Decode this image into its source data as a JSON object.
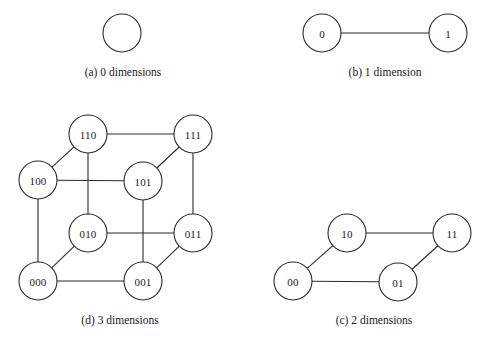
{
  "figure": {
    "background_color": "#ffffff",
    "stroke_color": "#2b2b2b",
    "node_fill_color": "#ffffff",
    "text_color": "#1a1a1a"
  },
  "chart_data": {
    "type": "diagram",
    "panels": [
      {
        "id": "a",
        "caption": "(a) 0 dimensions",
        "caption_x": 123,
        "caption_y": 72,
        "node_radius": 19,
        "nodes": [
          {
            "id": "a0",
            "label": "",
            "cx": 122,
            "cy": 33
          }
        ],
        "edges": []
      },
      {
        "id": "b",
        "caption": "(b) 1 dimension",
        "caption_x": 385,
        "caption_y": 72,
        "node_radius": 19,
        "nodes": [
          {
            "id": "b0",
            "label": "0",
            "cx": 322,
            "cy": 33
          },
          {
            "id": "b1",
            "label": "1",
            "cx": 448,
            "cy": 33
          }
        ],
        "edges": [
          {
            "from": "b0",
            "to": "b1"
          }
        ]
      },
      {
        "id": "c",
        "caption": "(c) 2 dimensions",
        "caption_x": 374,
        "caption_y": 320,
        "node_radius": 19,
        "nodes": [
          {
            "id": "c10",
            "label": "10",
            "cx": 347,
            "cy": 233
          },
          {
            "id": "c11",
            "label": "11",
            "cx": 452,
            "cy": 233
          },
          {
            "id": "c00",
            "label": "00",
            "cx": 293,
            "cy": 281
          },
          {
            "id": "c01",
            "label": "01",
            "cx": 398,
            "cy": 282
          }
        ],
        "edges": [
          {
            "from": "c10",
            "to": "c11"
          },
          {
            "from": "c00",
            "to": "c01"
          },
          {
            "from": "c00",
            "to": "c10"
          },
          {
            "from": "c01",
            "to": "c11"
          }
        ]
      },
      {
        "id": "d",
        "caption": "(d) 3 dimensions",
        "caption_x": 120,
        "caption_y": 320,
        "node_radius": 19,
        "nodes": [
          {
            "id": "d110",
            "label": "110",
            "cx": 88,
            "cy": 134
          },
          {
            "id": "d111",
            "label": "111",
            "cx": 193,
            "cy": 134
          },
          {
            "id": "d100",
            "label": "100",
            "cx": 38,
            "cy": 180
          },
          {
            "id": "d101",
            "label": "101",
            "cx": 143,
            "cy": 181
          },
          {
            "id": "d010",
            "label": "010",
            "cx": 88,
            "cy": 233
          },
          {
            "id": "d011",
            "label": "011",
            "cx": 193,
            "cy": 233
          },
          {
            "id": "d000",
            "label": "000",
            "cx": 38,
            "cy": 281
          },
          {
            "id": "d001",
            "label": "001",
            "cx": 143,
            "cy": 281
          }
        ],
        "edges": [
          {
            "from": "d110",
            "to": "d111"
          },
          {
            "from": "d100",
            "to": "d101"
          },
          {
            "from": "d010",
            "to": "d011"
          },
          {
            "from": "d000",
            "to": "d001"
          },
          {
            "from": "d110",
            "to": "d010"
          },
          {
            "from": "d111",
            "to": "d011"
          },
          {
            "from": "d100",
            "to": "d000"
          },
          {
            "from": "d101",
            "to": "d001"
          },
          {
            "from": "d100",
            "to": "d110"
          },
          {
            "from": "d101",
            "to": "d111"
          },
          {
            "from": "d000",
            "to": "d010"
          },
          {
            "from": "d001",
            "to": "d011"
          }
        ]
      }
    ]
  }
}
